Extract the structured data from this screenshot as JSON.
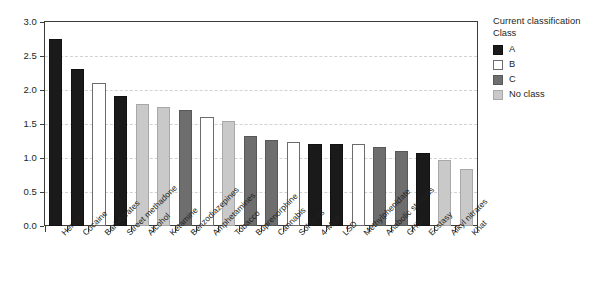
{
  "chart_data": {
    "type": "bar",
    "title": "",
    "xlabel": "",
    "ylabel": "",
    "ylim": [
      0,
      3.0
    ],
    "ytick_labels": [
      "0.0",
      "0.5",
      "1.0",
      "1.5",
      "2.0",
      "2.5",
      "3.0"
    ],
    "ytick_values": [
      0,
      0.5,
      1.0,
      1.5,
      2.0,
      2.5,
      3.0
    ],
    "grid": true,
    "legend_position": "right",
    "categories": [
      "Heroin",
      "Cocaine",
      "Barbiturates",
      "Street methadone",
      "Alcohol",
      "Ketamine",
      "Benzodiazepines",
      "Amphetamines",
      "Tobacco",
      "Buprenorphine",
      "Cannabis",
      "Solvents",
      "4-MTA",
      "LSD",
      "Methylphenidate",
      "Anabolic steroids",
      "GHB",
      "Ecstasy",
      "Alkyl nitrates",
      "Khat"
    ],
    "values": [
      2.75,
      2.31,
      2.1,
      1.91,
      1.8,
      1.75,
      1.7,
      1.61,
      1.55,
      1.32,
      1.27,
      1.24,
      1.21,
      1.21,
      1.21,
      1.16,
      1.1,
      1.08,
      0.97,
      0.84
    ],
    "classes": [
      "A",
      "A",
      "B",
      "A",
      "No class",
      "No class",
      "C",
      "B",
      "No class",
      "C",
      "C",
      "B",
      "A",
      "A",
      "B",
      "C",
      "C",
      "A",
      "No class",
      "No class"
    ],
    "class_keys": [
      "A",
      "A",
      "B",
      "A",
      "N",
      "N",
      "C",
      "B",
      "N",
      "C",
      "C",
      "B",
      "A",
      "A",
      "B",
      "C",
      "C",
      "A",
      "N",
      "N"
    ]
  },
  "legend": {
    "title": "Current classification",
    "subtitle": "Class",
    "items": [
      {
        "key": "A",
        "label": "A",
        "color": "#1a1a1a"
      },
      {
        "key": "B",
        "label": "B",
        "color": "#ffffff"
      },
      {
        "key": "C",
        "label": "C",
        "color": "#6e6e6e"
      },
      {
        "key": "N",
        "label": "No class",
        "color": "#c9c9c9"
      }
    ]
  }
}
